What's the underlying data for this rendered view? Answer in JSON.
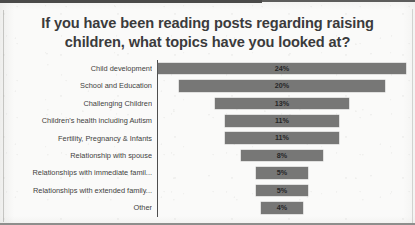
{
  "chart_data": {
    "type": "bar",
    "orientation": "horizontal",
    "layout": "centered-funnel",
    "title": "If you have been reading posts regarding raising children, what topics have you looked at?",
    "title_lines": [
      "If you have been reading posts regarding raising",
      "children, what topics have you looked at?"
    ],
    "xlabel": "",
    "ylabel": "",
    "grid": false,
    "legend": "none",
    "axis_max": 24,
    "value_suffix": "%",
    "bar_color": "#777776",
    "axis_color": "#4e4e4e",
    "categories": [
      "Child development",
      "School and Education",
      "Challenging Children",
      "Children's health including Autism",
      "Fertility, Pregnancy & Infants",
      "Relationship with spouse",
      "Relationships with immediate famil...",
      "Relationships with extended family...",
      "Other"
    ],
    "values": [
      24,
      20,
      13,
      11,
      11,
      8,
      5,
      5,
      4
    ],
    "value_labels": [
      "24%",
      "20%",
      "13%",
      "11%",
      "11%",
      "8%",
      "5%",
      "5%",
      "4%"
    ]
  }
}
